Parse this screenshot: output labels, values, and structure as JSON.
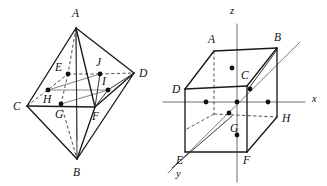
{
  "figure": {
    "title": "",
    "background_color": "#ffffff",
    "ink_color": "#111111",
    "gray_color": "#8a8a8a"
  },
  "left_figure": {
    "name": "octahedron-with-inscribed-points",
    "vertex_labels": {
      "A": "A",
      "B": "B",
      "C": "C",
      "D": "D",
      "E": "E",
      "F": "F",
      "G": "G",
      "H": "H",
      "I": "I",
      "J": "J"
    },
    "vertices": [
      {
        "id": "A",
        "label": "A",
        "x": 76,
        "y": 28,
        "label_x": 72,
        "label_y": 17
      },
      {
        "id": "B",
        "label": "B",
        "x": 77,
        "y": 159,
        "label_x": 73,
        "label_y": 176
      },
      {
        "id": "C",
        "label": "C",
        "x": 27,
        "y": 106,
        "label_x": 13,
        "label_y": 110
      },
      {
        "id": "D",
        "label": "D",
        "x": 134,
        "y": 73,
        "label_x": 139,
        "label_y": 77
      }
    ],
    "interior_points": [
      {
        "id": "E",
        "label": "E",
        "x": 68,
        "y": 74,
        "label_x": 55,
        "label_y": 71
      },
      {
        "id": "J",
        "label": "J",
        "x": 100,
        "y": 74,
        "label_x": 96,
        "label_y": 66
      },
      {
        "id": "I",
        "label": "I",
        "x": 108,
        "y": 90,
        "label_x": 102,
        "label_y": 85
      },
      {
        "id": "H",
        "label": "H",
        "x": 48,
        "y": 90,
        "label_x": 43,
        "label_y": 103
      },
      {
        "id": "G",
        "label": "G",
        "x": 61,
        "y": 104,
        "label_x": 55,
        "label_y": 118
      },
      {
        "id": "F",
        "label": "F",
        "x": 95,
        "y": 107,
        "label_x": 92,
        "label_y": 120
      }
    ]
  },
  "right_figure": {
    "name": "cube-with-coordinate-axes",
    "axis_labels": {
      "x": "x",
      "y": "y",
      "z": "z"
    },
    "axes": [
      {
        "id": "z",
        "label": "z",
        "label_x": 230,
        "label_y": 14
      },
      {
        "id": "x",
        "label": "x",
        "label_x": 312,
        "label_y": 102
      },
      {
        "id": "y",
        "label": "y",
        "label_x": 176,
        "label_y": 177
      }
    ],
    "vertex_labels": {
      "A": "A",
      "B": "B",
      "C": "C",
      "D": "D",
      "E": "E",
      "F": "F",
      "G": "G",
      "H": "H"
    },
    "vertices": [
      {
        "id": "A",
        "label": "A",
        "x": 214,
        "y": 51,
        "label_x": 208,
        "label_y": 43
      },
      {
        "id": "B",
        "label": "B",
        "x": 277,
        "y": 48,
        "label_x": 274,
        "label_y": 41
      },
      {
        "id": "C",
        "label": "C",
        "x": 247,
        "y": 86,
        "label_x": 241,
        "label_y": 79
      },
      {
        "id": "D",
        "label": "D",
        "x": 185,
        "y": 89,
        "label_x": 172,
        "label_y": 93
      },
      {
        "id": "E",
        "label": "E",
        "x": 185,
        "y": 152,
        "label_x": 176,
        "label_y": 164
      },
      {
        "id": "F",
        "label": "F",
        "x": 247,
        "y": 152,
        "label_x": 243,
        "label_y": 164
      },
      {
        "id": "G",
        "label": "G",
        "x": 236,
        "y": 118,
        "label_x": 230,
        "label_y": 132
      },
      {
        "id": "H",
        "label": "H",
        "x": 277,
        "y": 117,
        "label_x": 282,
        "label_y": 122
      }
    ],
    "marked_points": [
      {
        "id": "p-z-upper",
        "x": 232,
        "y": 68
      },
      {
        "id": "p-x-left",
        "x": 206,
        "y": 102
      },
      {
        "id": "p-origin",
        "x": 237,
        "y": 102
      },
      {
        "id": "p-x-right",
        "x": 268,
        "y": 102
      },
      {
        "id": "p-diag",
        "x": 229,
        "y": 113
      },
      {
        "id": "p-c",
        "x": 250,
        "y": 89
      },
      {
        "id": "p-z-lower",
        "x": 237,
        "y": 135
      }
    ]
  }
}
